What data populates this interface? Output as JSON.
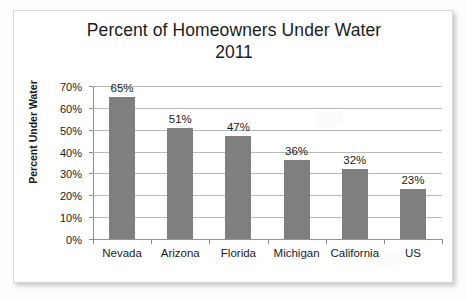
{
  "chart_data": {
    "type": "bar",
    "title": "Percent of Homeowners Under Water",
    "subtitle": "2011",
    "xlabel": "",
    "ylabel": "Percent Under Water",
    "categories": [
      "Nevada",
      "Arizona",
      "Florida",
      "Michigan",
      "California",
      "US"
    ],
    "values": [
      65,
      51,
      47,
      36,
      32,
      23
    ],
    "value_labels": [
      "65%",
      "51%",
      "47%",
      "36%",
      "32%",
      "23%"
    ],
    "ylim": [
      0,
      70
    ],
    "ytick_values": [
      0,
      10,
      20,
      30,
      40,
      50,
      60,
      70
    ],
    "ytick_labels": [
      "0%",
      "10%",
      "20%",
      "30%",
      "40%",
      "50%",
      "60%",
      "70%"
    ],
    "grid": true,
    "legend": null,
    "legend_position": "none",
    "series": [
      {
        "name": "Percent Under Water",
        "values": [
          65,
          51,
          47,
          36,
          32,
          23
        ],
        "color": "#7f7f7f"
      }
    ]
  },
  "colors": {
    "bar": "#7f7f7f",
    "gridline": "#b9b9b9",
    "axis": "#8d8d8d",
    "text": "#1b1b1b",
    "card_background": "#ffffff",
    "card_border": "#d8d8d8",
    "page_background": "#fdfdfd"
  }
}
